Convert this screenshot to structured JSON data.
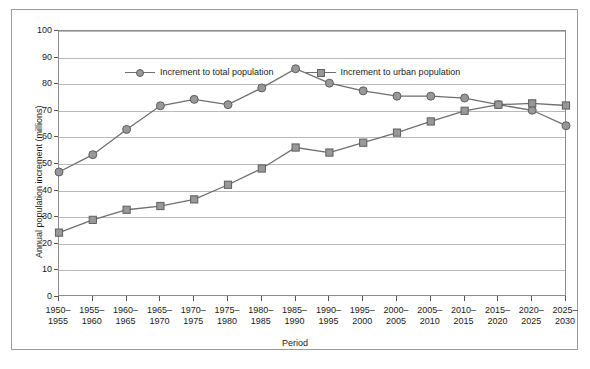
{
  "chart_data": {
    "type": "line",
    "title": "",
    "xlabel": "Period",
    "ylabel": "Annual population increment (millions)",
    "ylim": [
      0,
      100
    ],
    "ytick_step": 10,
    "yticks": [
      "0",
      "10",
      "20",
      "30",
      "40",
      "50",
      "60",
      "70",
      "80",
      "90",
      "100"
    ],
    "grid": true,
    "legend_position": "top-left-inside",
    "categories": [
      "1950–\n1955",
      "1955–\n1960",
      "1960–\n1965",
      "1965–\n1970",
      "1970–\n1975",
      "1975–\n1980",
      "1980–\n1985",
      "1985–\n1990",
      "1990–\n1995",
      "1995–\n2000",
      "2000–\n2005",
      "2005–\n2010",
      "2010–\n2015",
      "2015–\n2020",
      "2020–\n2025",
      "2025–\n2030"
    ],
    "series": [
      {
        "name": "Increment to total population",
        "marker": "circle",
        "color": "#989898",
        "line_color": "#6e6e6e",
        "values": [
          47.0,
          53.5,
          63.0,
          71.9,
          74.3,
          72.3,
          78.6,
          85.8,
          80.4,
          77.5,
          75.5,
          75.5,
          74.8,
          72.3,
          70.2,
          64.4
        ]
      },
      {
        "name": "Increment to urban population",
        "marker": "square",
        "color": "#989898",
        "line_color": "#6e6e6e",
        "values": [
          24.2,
          29.0,
          32.8,
          34.2,
          36.7,
          42.2,
          48.3,
          56.2,
          54.3,
          58.0,
          61.8,
          66.0,
          70.0,
          72.3,
          72.8,
          72.0
        ]
      }
    ]
  },
  "colors": {
    "marker_fill": "#989898",
    "marker_edge": "#5f5f5f",
    "line": "#6e6e6e",
    "grid": "#b9b9b9",
    "axis": "#8d8d8d",
    "frame": "#9a9a9a",
    "text": "#1a1a1a",
    "background": "#ffffff"
  },
  "legend": {
    "items": [
      {
        "label": "Increment to total population",
        "marker": "circle-marker"
      },
      {
        "label": "Increment to urban population",
        "marker": "square-marker"
      }
    ]
  }
}
